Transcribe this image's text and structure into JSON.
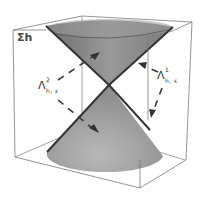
{
  "figure": {
    "labels": {
      "surface": "Σh",
      "lambda2": {
        "base": "Λ",
        "sup": "2",
        "sub": "h, ε"
      },
      "lambda1": {
        "base": "Λ",
        "sup": "1",
        "sub": "h, ε"
      }
    },
    "colors": {
      "cube_edge": "#7a7a7a",
      "cone_top_fill": "#8c8c8c",
      "cone_bottom_fill": "#a9a9a9",
      "cone_edge": "#3a3a3a",
      "arrow": "#3a3a3a"
    }
  }
}
